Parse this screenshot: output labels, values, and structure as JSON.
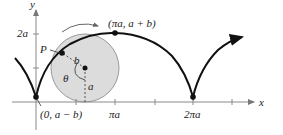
{
  "diagram": {
    "type": "prolate/curtate trochoid with rolling circle",
    "axes": {
      "x_label": "x",
      "y_label": "y",
      "x_ticks": [
        "πa",
        "2πa"
      ],
      "y_ticks": [
        "2a"
      ]
    },
    "labels": {
      "top_point": "(πa, a + b)",
      "start_point": "(0, a − b)",
      "point_p": "P",
      "radius_b": "b",
      "radius_a": "a",
      "angle": "θ",
      "tick_pi_a": "πa",
      "tick_2pi_a": "2πa",
      "tick_2a": "2a",
      "axis_x": "x",
      "axis_y": "y"
    },
    "colors": {
      "curve": "#111111",
      "circle_fill": "#dcdcdc",
      "circle_stroke": "#9a9a9a",
      "axis": "#8a8a8a",
      "text": "#222222"
    }
  }
}
